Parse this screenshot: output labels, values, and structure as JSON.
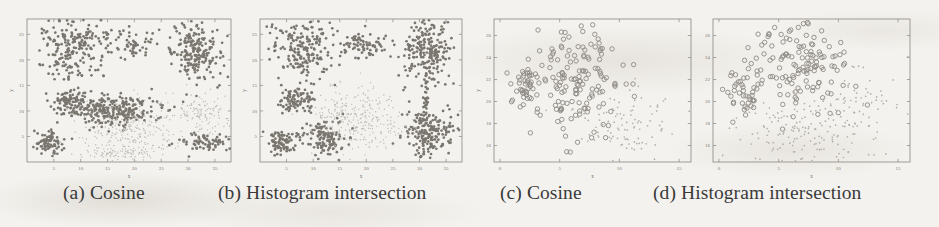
{
  "figure": {
    "background_color": "#f4f2ee",
    "ink_color": "#3a3a3a",
    "panel_count": 4
  },
  "captions": {
    "a": "(a) Cosine",
    "b": "(b) Histogram intersection",
    "c": "(c) Cosine",
    "d": "(d) Histogram intersection"
  },
  "chart_data": [
    {
      "type": "scatter",
      "title": "(a) Cosine",
      "panel": "a",
      "xlabel": "x",
      "ylabel": "y",
      "xlim": [
        0,
        38
      ],
      "ylim": [
        0,
        28
      ],
      "xticks": [
        5,
        10,
        15,
        20,
        25,
        30,
        35
      ],
      "yticks": [
        5,
        10,
        15,
        20,
        25
      ],
      "grid": false,
      "legend": "none",
      "marker": "filled-dot",
      "series": [
        {
          "name": "dense-cluster-upper-left",
          "density": "dark",
          "n": 230,
          "cx": 9.0,
          "cy": 22.5,
          "sx": 3.6,
          "sy": 3.2
        },
        {
          "name": "cluster-upper-mid",
          "density": "dark",
          "n": 55,
          "cx": 19.5,
          "cy": 23.0,
          "sx": 2.2,
          "sy": 1.5
        },
        {
          "name": "cluster-upper-right-tree",
          "density": "dark",
          "n": 210,
          "cx": 31.5,
          "cy": 21.5,
          "sx": 2.2,
          "sy": 3.0
        },
        {
          "name": "cluster-mid-left",
          "density": "dark",
          "n": 90,
          "cx": 8.0,
          "cy": 12.0,
          "sx": 1.9,
          "sy": 1.1
        },
        {
          "name": "band-diagonal-mid",
          "density": "dark",
          "n": 280,
          "cx": 16.0,
          "cy": 10.0,
          "sx": 4.2,
          "sy": 1.6
        },
        {
          "name": "cluster-lower-left",
          "density": "dark",
          "n": 85,
          "cx": 4.2,
          "cy": 4.0,
          "sx": 1.3,
          "sy": 1.1
        },
        {
          "name": "cluster-lower-right",
          "density": "dark",
          "n": 70,
          "cx": 33.0,
          "cy": 4.0,
          "sx": 2.2,
          "sy": 0.9
        },
        {
          "name": "sparse-cloud-lower-mid",
          "density": "light",
          "n": 250,
          "cx": 19.0,
          "cy": 6.5,
          "sx": 4.6,
          "sy": 2.6
        },
        {
          "name": "sparse-cloud-right",
          "density": "light",
          "n": 120,
          "cx": 32.5,
          "cy": 10.0,
          "sx": 2.4,
          "sy": 2.0
        },
        {
          "name": "sparse-strip-bottom",
          "density": "light",
          "n": 90,
          "cx": 18.0,
          "cy": 1.6,
          "sx": 4.0,
          "sy": 0.8
        }
      ]
    },
    {
      "type": "scatter",
      "title": "(b) Histogram intersection",
      "panel": "b",
      "xlabel": "x",
      "ylabel": "y",
      "xlim": [
        0,
        38
      ],
      "ylim": [
        0,
        28
      ],
      "xticks": [
        5,
        10,
        15,
        20,
        25,
        30,
        35
      ],
      "yticks": [
        5,
        10,
        15,
        20,
        25
      ],
      "grid": false,
      "legend": "none",
      "marker": "filled-dot",
      "series": [
        {
          "name": "cluster-upper-left",
          "density": "dark",
          "n": 200,
          "cx": 8.5,
          "cy": 22.5,
          "sx": 3.4,
          "sy": 3.2
        },
        {
          "name": "cluster-upper-mid",
          "density": "dark",
          "n": 80,
          "cx": 19.5,
          "cy": 23.0,
          "sx": 2.4,
          "sy": 1.4
        },
        {
          "name": "cluster-upper-right",
          "density": "dark",
          "n": 230,
          "cx": 31.5,
          "cy": 21.5,
          "sx": 2.3,
          "sy": 3.2
        },
        {
          "name": "cluster-mid-left",
          "density": "dark",
          "n": 95,
          "cx": 7.0,
          "cy": 12.0,
          "sx": 1.8,
          "sy": 1.2
        },
        {
          "name": "cluster-lower-left",
          "density": "dark",
          "n": 85,
          "cx": 4.2,
          "cy": 4.0,
          "sx": 1.4,
          "sy": 1.1
        },
        {
          "name": "cluster-lower-mid",
          "density": "dark",
          "n": 130,
          "cx": 12.0,
          "cy": 5.0,
          "sx": 1.9,
          "sy": 1.8
        },
        {
          "name": "cluster-lower-right",
          "density": "dark",
          "n": 200,
          "cx": 32.0,
          "cy": 5.5,
          "sx": 2.3,
          "sy": 2.6
        },
        {
          "name": "bridge-right",
          "density": "dark",
          "n": 25,
          "cx": 31.3,
          "cy": 12.5,
          "sx": 0.3,
          "sy": 2.2
        },
        {
          "name": "sparse-cloud-center",
          "density": "light",
          "n": 320,
          "cx": 18.0,
          "cy": 8.5,
          "sx": 4.4,
          "sy": 2.8
        }
      ]
    },
    {
      "type": "scatter",
      "title": "(c) Cosine",
      "panel": "c",
      "xlabel": "x",
      "ylabel": "y",
      "xlim": [
        -0.5,
        16
      ],
      "ylim": [
        14.5,
        27.5
      ],
      "xticks": [
        0,
        5,
        10,
        15
      ],
      "yticks": [
        16,
        18,
        20,
        22,
        24,
        26
      ],
      "grid": false,
      "legend": "none",
      "marker": "open-circle",
      "series": [
        {
          "name": "cluster-main-circles",
          "density": "dark",
          "n": 150,
          "cx": 6.8,
          "cy": 21.8,
          "sx": 1.9,
          "sy": 2.9
        },
        {
          "name": "cluster-left-circles",
          "density": "dark",
          "n": 45,
          "cx": 2.2,
          "cy": 21.2,
          "sx": 0.8,
          "sy": 1.2
        },
        {
          "name": "sparse-cloud-lower-right",
          "density": "light",
          "n": 110,
          "cx": 10.5,
          "cy": 17.8,
          "sx": 2.2,
          "sy": 1.6
        }
      ]
    },
    {
      "type": "scatter",
      "title": "(d) Histogram intersection",
      "panel": "d",
      "xlabel": "x",
      "ylabel": "y",
      "xlim": [
        -0.5,
        16
      ],
      "ylim": [
        14.5,
        27.5
      ],
      "xticks": [
        0,
        5,
        10,
        15
      ],
      "yticks": [
        16,
        18,
        20,
        22,
        24,
        26
      ],
      "grid": false,
      "legend": "none",
      "marker": "open-circle",
      "series": [
        {
          "name": "cluster-upper-circles",
          "density": "dark",
          "n": 135,
          "cx": 6.6,
          "cy": 23.2,
          "sx": 1.9,
          "sy": 2.1
        },
        {
          "name": "cluster-left-circles",
          "density": "dark",
          "n": 40,
          "cx": 2.0,
          "cy": 20.8,
          "sx": 0.8,
          "sy": 1.2
        },
        {
          "name": "sparse-cloud-lower",
          "density": "light",
          "n": 150,
          "cx": 6.8,
          "cy": 17.5,
          "sx": 2.2,
          "sy": 1.6
        },
        {
          "name": "sparse-cloud-right",
          "density": "light",
          "n": 70,
          "cx": 11.5,
          "cy": 19.5,
          "sx": 1.6,
          "sy": 1.8
        }
      ]
    }
  ]
}
